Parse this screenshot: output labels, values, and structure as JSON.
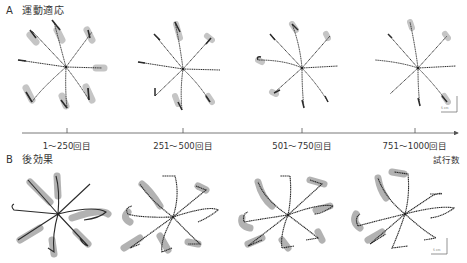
{
  "panels": {
    "A": {
      "letter": "A",
      "title": "運動適応"
    },
    "B": {
      "letter": "B",
      "title": "後効果"
    }
  },
  "timeline": {
    "axis_label": "試行数",
    "ticks": [
      {
        "label": "1〜250回目",
        "x": 67
      },
      {
        "label": "251〜500回目",
        "x": 183
      },
      {
        "label": "501〜750回目",
        "x": 302
      },
      {
        "label": "751〜1000回目",
        "x": 415
      }
    ]
  },
  "scale_bar": {
    "label": "5 cm"
  },
  "colors": {
    "trajectory": "#2a2a2a",
    "variability_band": "#b8b8b8",
    "axis": "#555555"
  }
}
